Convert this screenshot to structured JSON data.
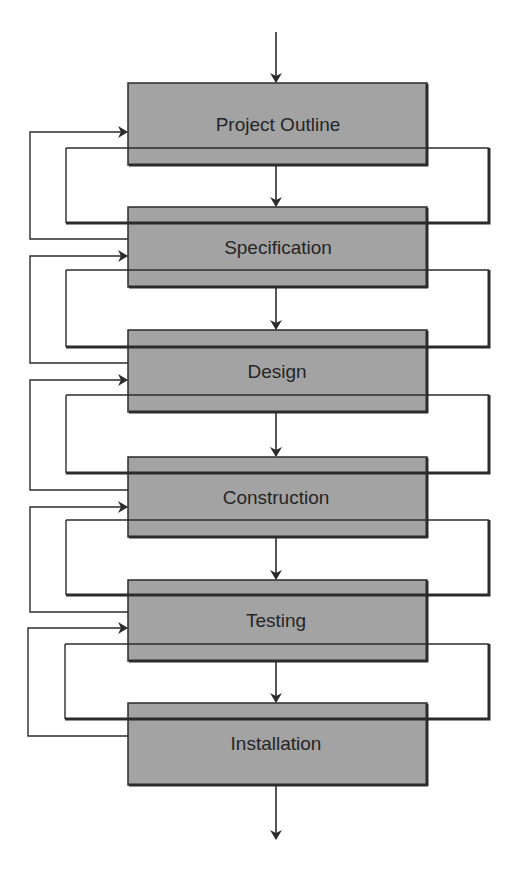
{
  "diagram": {
    "type": "waterfall-flowchart",
    "stages": [
      {
        "label": "Project Outline"
      },
      {
        "label": "Specification"
      },
      {
        "label": "Design"
      },
      {
        "label": "Construction"
      },
      {
        "label": "Testing"
      },
      {
        "label": "Installation"
      }
    ],
    "colors": {
      "box_fill": "#a3a3a3",
      "line": "#2b2b2b",
      "text": "#262626",
      "background": "#ffffff"
    }
  }
}
